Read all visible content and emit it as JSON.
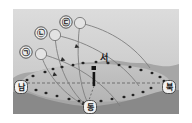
{
  "figure": {
    "frame_bg": "#ffffff",
    "sky_top_color": "#d8d8d8",
    "sky_bottom_color": "#c6c6c6",
    "ridge_far_color": "#a9a9a9",
    "ridge_near_color": "#8f8f8f",
    "basin_color": "#bdbdbd",
    "path_line_color": "#8a8a8a",
    "dashed_line_color": "#6f6f6f",
    "marker_color": "#1c1c1c"
  },
  "direction_labels": [
    {
      "id": "west",
      "text": "서",
      "x": 104,
      "y": 58,
      "boxed": false
    },
    {
      "id": "south-left",
      "text": "남",
      "x": 21,
      "y": 87,
      "boxed": true
    },
    {
      "id": "north-right",
      "text": "북",
      "x": 169,
      "y": 87,
      "boxed": true
    },
    {
      "id": "east-bottom",
      "text": "동",
      "x": 90,
      "y": 107,
      "boxed": true
    }
  ],
  "path_labels": [
    {
      "id": "path-a",
      "text": "㉠",
      "x": 26,
      "y": 52,
      "sun_x": 41,
      "sun_y": 54
    },
    {
      "id": "path-b",
      "text": "㉡",
      "x": 41,
      "y": 33,
      "sun_x": 55,
      "sun_y": 35
    },
    {
      "id": "path-c",
      "text": "㉢",
      "x": 66,
      "y": 22,
      "sun_x": 80,
      "sun_y": 23
    }
  ],
  "sun_paths": [
    {
      "id": "arc-a",
      "label": "㉠",
      "d": "M41,54 C45,70 60,92 84,105",
      "arrow_at": [
        56,
        74
      ]
    },
    {
      "id": "arc-b",
      "label": "㉡",
      "d": "M55,35 C56,58 66,88 86,105",
      "arrow_at": [
        63,
        59
      ]
    },
    {
      "id": "arc-c",
      "label": "㉢",
      "d": "M80,23 C76,50 78,82 88,104",
      "arrow_at": [
        77,
        45
      ]
    },
    {
      "id": "arc-c-far",
      "label": "㉢-서편",
      "d": "M80,23 C112,30 136,48 150,68",
      "arrow_at": null
    },
    {
      "id": "arc-b-far",
      "label": "㉡-서편",
      "d": "M55,35 C90,42 122,62 139,86",
      "arrow_at": null
    },
    {
      "id": "arc-a-far",
      "label": "㉠-서편",
      "d": "M41,54 C72,62 104,82 120,106",
      "arrow_at": null
    }
  ],
  "gnomon": {
    "id": "center-gnomon",
    "x": 94,
    "top_y": 68,
    "bottom_y": 88,
    "cap_label": "관측 막대"
  },
  "horizon_line": {
    "id": "east-west-axis",
    "x1": 22,
    "x2": 170,
    "y": 83,
    "style": "dashed"
  },
  "trees": [
    [
      33,
      76
    ],
    [
      45,
      72
    ],
    [
      53,
      69
    ],
    [
      62,
      67
    ],
    [
      73,
      65
    ],
    [
      83,
      63
    ],
    [
      96,
      62
    ],
    [
      108,
      63
    ],
    [
      119,
      65
    ],
    [
      130,
      67
    ],
    [
      141,
      70
    ],
    [
      152,
      73
    ],
    [
      160,
      77
    ],
    [
      36,
      90
    ],
    [
      46,
      93
    ],
    [
      57,
      96
    ],
    [
      69,
      99
    ],
    [
      79,
      101
    ],
    [
      101,
      101
    ],
    [
      112,
      99
    ],
    [
      124,
      97
    ],
    [
      133,
      95
    ],
    [
      143,
      92
    ],
    [
      151,
      88
    ],
    [
      27,
      80
    ],
    [
      164,
      81
    ]
  ]
}
